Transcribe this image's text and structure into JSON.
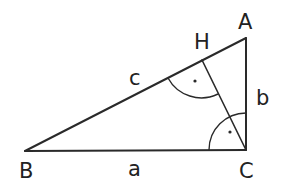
{
  "diagram": {
    "colors": {
      "stroke": "#2a2a2a",
      "text": "#222222",
      "background": "#ffffff"
    },
    "vertices": {
      "A": {
        "label": "A",
        "x": 246,
        "y": 38
      },
      "B": {
        "label": "B",
        "x": 25,
        "y": 151
      },
      "C": {
        "label": "C",
        "x": 246,
        "y": 150
      },
      "H": {
        "label": "H",
        "x": 202,
        "y": 60
      }
    },
    "sides": {
      "a": {
        "label": "a",
        "from": "B",
        "to": "C"
      },
      "b": {
        "label": "b",
        "from": "C",
        "to": "A"
      },
      "c": {
        "label": "c",
        "from": "B",
        "to": "A"
      }
    },
    "altitude": {
      "from": "C",
      "to": "H"
    },
    "right_angle_marks": [
      {
        "at": "H",
        "marker": "arc-with-dot"
      },
      {
        "at": "C",
        "marker": "arc-with-dot"
      }
    ]
  }
}
